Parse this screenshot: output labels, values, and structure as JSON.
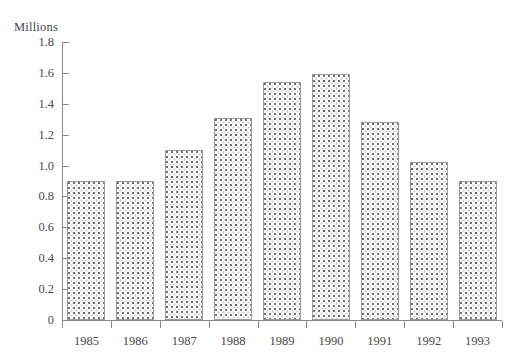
{
  "chart_data": {
    "type": "bar",
    "title": "",
    "unit_caption": "Millions",
    "xlabel": "",
    "ylabel": "Millions",
    "categories": [
      "1985",
      "1986",
      "1987",
      "1988",
      "1989",
      "1990",
      "1991",
      "1992",
      "1993"
    ],
    "values": [
      0.9,
      0.9,
      1.1,
      1.31,
      1.54,
      1.59,
      1.28,
      1.02,
      0.9
    ],
    "ylim": [
      0,
      1.8
    ],
    "ytick_values": [
      0,
      0.2,
      0.4,
      0.6,
      0.8,
      1.0,
      1.2,
      1.4,
      1.6,
      1.8
    ],
    "ytick_labels": [
      "0",
      "0.2",
      "0.4",
      "0.6",
      "0.8",
      "1.0",
      "1.2",
      "1.4",
      "1.6",
      "1.8"
    ],
    "grid": false,
    "legend": false,
    "legend_position": "none",
    "series": [
      {
        "name": "Millions",
        "values": [
          0.9,
          0.9,
          1.1,
          1.31,
          1.54,
          1.59,
          1.28,
          1.02,
          0.9
        ]
      }
    ],
    "colors": {
      "bar_fill": "#ffffff",
      "bar_pattern_dot": "#6f6f6f",
      "bar_border": "#9b9b9b",
      "axis": "#8a8a8a",
      "text": "#4a4a4a",
      "background": "#ffffff"
    }
  }
}
